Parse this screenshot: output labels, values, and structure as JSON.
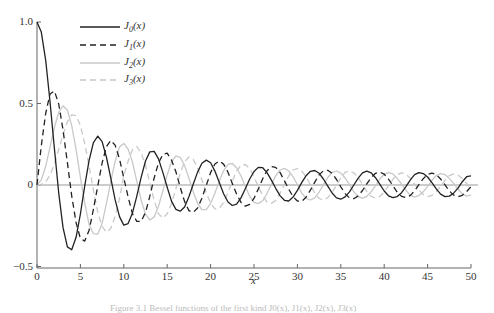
{
  "chart_data": {
    "type": "line",
    "title": "",
    "xlabel": "x",
    "ylabel": "",
    "xlim": [
      0,
      50
    ],
    "ylim": [
      -0.5,
      1.0
    ],
    "grid": false,
    "legend_position": "upper-left",
    "x_ticks": [
      "0",
      "5",
      "10",
      "15",
      "20",
      "25",
      "30",
      "35",
      "40",
      "45",
      "50"
    ],
    "y_ticks": [
      "-0.5",
      "0",
      "0.5",
      "1.0"
    ],
    "x_step": 0.5,
    "x_start": 0,
    "series": [
      {
        "name": "J0(x)",
        "sub": "0",
        "style": "solid",
        "color": "#222222",
        "values": [
          1.0,
          0.938,
          0.765,
          0.512,
          0.224,
          -0.048,
          -0.26,
          -0.38,
          -0.397,
          -0.321,
          -0.178,
          -0.007,
          0.151,
          0.26,
          0.3,
          0.266,
          0.172,
          0.042,
          -0.09,
          -0.194,
          -0.246,
          -0.237,
          -0.171,
          -0.068,
          0.048,
          0.147,
          0.203,
          0.206,
          0.16,
          0.076,
          -0.014,
          -0.099,
          -0.15,
          -0.161,
          -0.135,
          -0.072,
          0.005,
          0.079,
          0.134,
          0.153,
          0.137,
          0.085,
          0.016,
          -0.054,
          -0.104,
          -0.126,
          -0.117,
          -0.079,
          -0.023,
          0.037,
          0.083,
          0.108,
          0.106,
          0.076,
          0.03,
          -0.02,
          -0.065,
          -0.094,
          -0.098,
          -0.074,
          -0.033,
          0.015,
          0.057,
          0.084,
          0.089,
          0.072,
          0.037,
          -0.007,
          -0.049,
          -0.079,
          -0.087,
          -0.073,
          -0.042,
          0.0,
          0.042,
          0.074,
          0.085,
          0.074,
          0.045,
          0.004,
          -0.037,
          -0.066,
          -0.078,
          -0.071,
          -0.047,
          -0.01,
          0.03,
          0.063,
          0.076,
          0.07,
          0.049,
          0.015,
          -0.024,
          -0.056,
          -0.071,
          -0.068,
          -0.05,
          -0.019,
          0.02,
          0.051,
          0.056
        ]
      },
      {
        "name": "J1(x)",
        "sub": "1",
        "style": "dashed",
        "color": "#222222",
        "values": [
          0.0,
          0.242,
          0.44,
          0.558,
          0.577,
          0.497,
          0.339,
          0.137,
          -0.066,
          -0.231,
          -0.328,
          -0.344,
          -0.277,
          -0.15,
          -0.005,
          0.135,
          0.235,
          0.273,
          0.245,
          0.16,
          0.043,
          -0.073,
          -0.177,
          -0.223,
          -0.223,
          -0.168,
          -0.07,
          0.044,
          0.135,
          0.188,
          0.195,
          0.153,
          0.081,
          -0.013,
          -0.102,
          -0.157,
          -0.168,
          -0.141,
          -0.081,
          -0.002,
          0.076,
          0.129,
          0.147,
          0.128,
          0.078,
          0.01,
          -0.056,
          -0.107,
          -0.13,
          -0.119,
          -0.082,
          -0.024,
          0.038,
          0.087,
          0.113,
          0.108,
          0.077,
          0.027,
          -0.026,
          -0.072,
          -0.098,
          -0.1,
          -0.075,
          -0.032,
          0.018,
          0.062,
          0.087,
          0.09,
          0.071,
          0.034,
          -0.011,
          -0.053,
          -0.079,
          -0.084,
          -0.067,
          -0.034,
          0.007,
          0.046,
          0.072,
          0.079,
          0.066,
          0.036,
          -0.004,
          -0.044,
          -0.07,
          -0.077,
          -0.065,
          -0.036,
          0.002,
          0.039,
          0.065,
          0.073,
          0.063,
          0.037,
          0.001,
          -0.036,
          -0.062,
          -0.072,
          -0.063,
          -0.04,
          -0.01
        ]
      },
      {
        "name": "J2(x)",
        "sub": "2",
        "style": "solid",
        "color": "#c8c8c8",
        "values": [
          0.0,
          0.031,
          0.115,
          0.232,
          0.353,
          0.446,
          0.486,
          0.459,
          0.364,
          0.217,
          0.047,
          -0.11,
          -0.243,
          -0.299,
          -0.301,
          -0.237,
          -0.113,
          0.02,
          0.145,
          0.233,
          0.255,
          0.22,
          0.139,
          0.022,
          -0.093,
          -0.179,
          -0.215,
          -0.196,
          -0.13,
          -0.036,
          0.063,
          0.141,
          0.179,
          0.17,
          0.119,
          0.043,
          -0.041,
          -0.112,
          -0.151,
          -0.151,
          -0.113,
          -0.05,
          0.024,
          0.088,
          0.127,
          0.132,
          0.106,
          0.055,
          -0.008,
          -0.069,
          -0.106,
          -0.114,
          -0.097,
          -0.052,
          0.003,
          0.056,
          0.092,
          0.102,
          0.086,
          0.05,
          0.001,
          -0.049,
          -0.083,
          -0.092,
          -0.079,
          -0.044,
          0.002,
          0.046,
          0.077,
          0.086,
          0.073,
          0.043,
          0.002,
          -0.041,
          -0.071,
          -0.081,
          -0.07,
          -0.042,
          -0.004,
          0.037,
          0.066,
          0.076,
          0.068,
          0.041,
          0.006,
          -0.032,
          -0.062,
          -0.074,
          -0.065,
          -0.041,
          -0.008,
          0.029,
          0.058,
          0.07,
          0.063,
          0.041,
          0.01,
          -0.026,
          -0.054,
          -0.068,
          -0.06
        ]
      },
      {
        "name": "J3(x)",
        "sub": "3",
        "style": "dashed",
        "color": "#c8c8c8",
        "values": [
          0.0,
          0.003,
          0.02,
          0.061,
          0.129,
          0.217,
          0.309,
          0.387,
          0.43,
          0.425,
          0.365,
          0.256,
          0.115,
          -0.029,
          -0.168,
          -0.254,
          -0.291,
          -0.265,
          -0.194,
          -0.083,
          0.058,
          0.146,
          0.217,
          0.236,
          0.195,
          0.123,
          0.014,
          -0.096,
          -0.177,
          -0.203,
          -0.176,
          -0.114,
          -0.022,
          0.072,
          0.143,
          0.172,
          0.158,
          0.105,
          0.032,
          -0.048,
          -0.111,
          -0.146,
          -0.143,
          -0.108,
          -0.046,
          0.023,
          0.085,
          0.121,
          0.126,
          0.1,
          0.05,
          -0.008,
          -0.066,
          -0.105,
          -0.113,
          -0.095,
          -0.051,
          0.004,
          0.055,
          0.092,
          0.101,
          0.087,
          0.051,
          0.0,
          -0.049,
          -0.083,
          -0.092,
          -0.078,
          -0.045,
          -0.002,
          0.044,
          0.077,
          0.087,
          0.075,
          0.045,
          0.003,
          -0.039,
          -0.07,
          -0.08,
          -0.07,
          -0.043,
          -0.004,
          0.035,
          0.064,
          0.075,
          0.066,
          0.042,
          0.006,
          -0.031,
          -0.059,
          -0.071,
          -0.064,
          -0.04,
          -0.008,
          0.029,
          0.057,
          0.068,
          0.061,
          0.039,
          0.009,
          -0.026
        ]
      }
    ]
  },
  "legend": {
    "items": [
      {
        "prefix": "J",
        "sub": "0",
        "suffix": "(x)"
      },
      {
        "prefix": "J",
        "sub": "1",
        "suffix": "(x)"
      },
      {
        "prefix": "J",
        "sub": "2",
        "suffix": "(x)"
      },
      {
        "prefix": "J",
        "sub": "3",
        "suffix": "(x)"
      }
    ]
  },
  "axes": {
    "x_title": "x",
    "y_labels": {
      "top": "1.0",
      "half": "0.5",
      "zero": "0",
      "neg": "−0.5"
    }
  },
  "caption": "Figure 3.1   Bessel functions of the first kind J0(x), J1(x), J2(x), J3(x)"
}
